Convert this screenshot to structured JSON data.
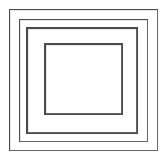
{
  "figure": {
    "background_color": "#ffffff",
    "canvas": {
      "width": 167,
      "height": 161
    },
    "text_content": "",
    "shape_count": 4
  },
  "chart_data": {
    "type": "diagram",
    "title": "",
    "shapes": [
      {
        "name": "outer-square",
        "label": "",
        "x": 9,
        "y": 9,
        "width": 149,
        "height": 142,
        "stroke_color": "#4d4d4d",
        "stroke_width": 1,
        "fill": "none"
      },
      {
        "name": "second-square",
        "label": "",
        "x": 19,
        "y": 19,
        "width": 129,
        "height": 123,
        "stroke_color": "#4d4d4d",
        "stroke_width": 1,
        "fill": "none"
      },
      {
        "name": "third-square",
        "label": "",
        "x": 26,
        "y": 27,
        "width": 112,
        "height": 107,
        "stroke_color": "#4a4a4a",
        "stroke_width": 2,
        "fill": "none"
      },
      {
        "name": "inner-square",
        "label": "",
        "x": 44,
        "y": 43,
        "width": 79,
        "height": 72,
        "stroke_color": "#4a4a4a",
        "stroke_width": 2,
        "fill": "none"
      }
    ]
  }
}
